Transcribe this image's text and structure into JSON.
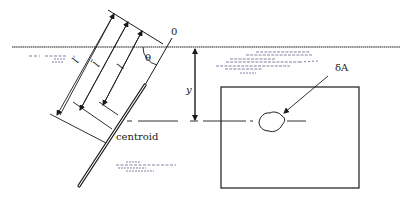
{
  "diagram": {
    "type": "hydrostatic-force-inclined-plane",
    "labels": {
      "origin": "0",
      "angle": "θ",
      "depth": "y",
      "element_area": "δA",
      "centroid": "centroid",
      "dim_outer": "l′",
      "dim_middle": "l̄",
      "dim_inner": "l"
    },
    "colors": {
      "ink": "#1a1a1a",
      "water_hatch": "#4a4a7a",
      "background": "#ffffff"
    }
  }
}
